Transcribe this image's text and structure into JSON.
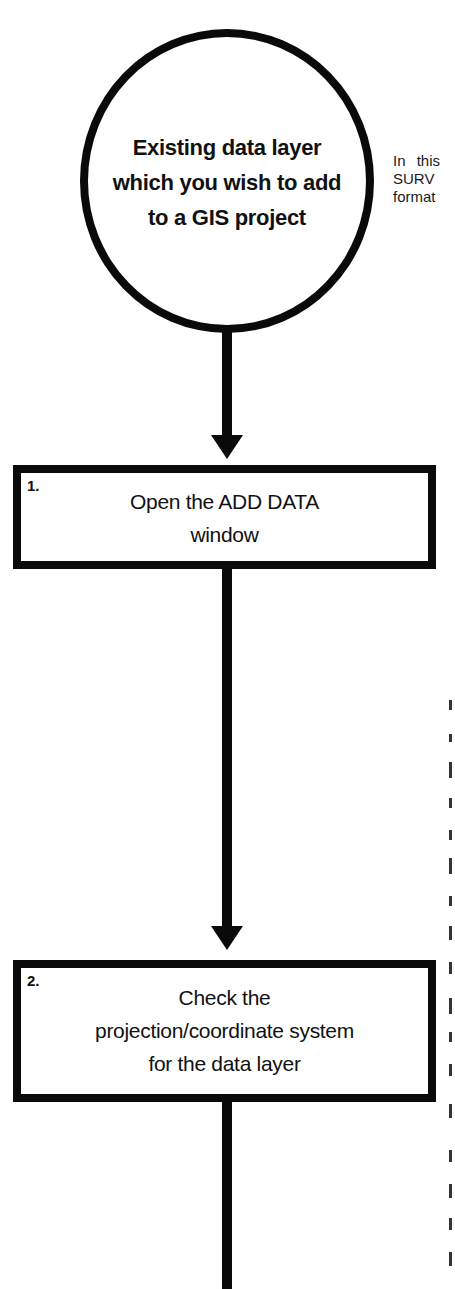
{
  "flowchart": {
    "start_node": {
      "shape": "circle",
      "label": "Existing data layer which you wish to add to a GIS project"
    },
    "side_note": {
      "lines": [
        "In this",
        "SURV",
        "format"
      ],
      "truncated": true
    },
    "steps": [
      {
        "number": "1.",
        "label_line1": "Open the ADD DATA",
        "label_line2": "window"
      },
      {
        "number": "2.",
        "label_line1": "Check the",
        "label_line2": "projection/coordinate system",
        "label_line3": "for the data layer"
      }
    ],
    "edges": [
      {
        "from": "start_node",
        "to": "step_1",
        "type": "arrow"
      },
      {
        "from": "step_1",
        "to": "step_2",
        "type": "arrow"
      },
      {
        "from": "step_2",
        "to": "next_step_offscreen",
        "type": "line"
      }
    ],
    "colors": {
      "stroke": "#0a0a0a",
      "background": "#ffffff",
      "text": "#111111"
    }
  }
}
